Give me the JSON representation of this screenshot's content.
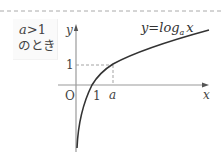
{
  "figure": {
    "condition": {
      "variable": "a",
      "relation": ">1",
      "caption": "のとき"
    },
    "axes": {
      "y_label": "y",
      "x_label": "x",
      "origin_label": "O"
    },
    "ticks": {
      "y_one": "1",
      "x_one": "1",
      "x_a": "a"
    },
    "curve": {
      "lhs": "y=log",
      "base": "a",
      "arg": "x"
    },
    "colors": {
      "curve": "#333333",
      "axis": "#9a9a9a",
      "dashed_guides": "#999999",
      "top_border": "#aaaaaa"
    }
  }
}
